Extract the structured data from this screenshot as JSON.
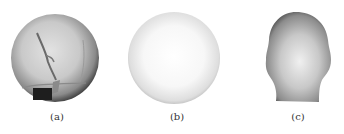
{
  "figure": {
    "panels": [
      {
        "id": "a",
        "label": "(a)",
        "subject": "textured-sphere-with-shading"
      },
      {
        "id": "b",
        "label": "(b)",
        "subject": "smooth-shaded-sphere"
      },
      {
        "id": "c",
        "label": "(c)",
        "subject": "shaded-head-shape"
      }
    ]
  }
}
